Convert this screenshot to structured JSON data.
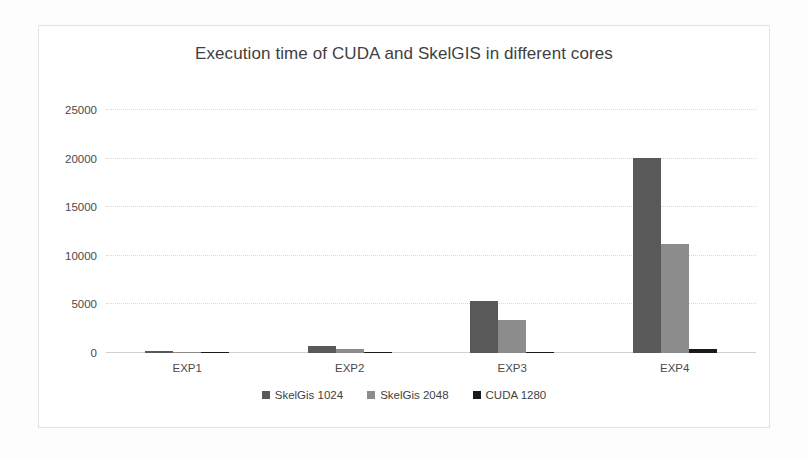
{
  "chart_data": {
    "type": "bar",
    "title": "Execution time of CUDA and SkelGIS in different cores",
    "xlabel": "",
    "ylabel": "",
    "categories": [
      "EXP1",
      "EXP2",
      "EXP3",
      "EXP4"
    ],
    "series": [
      {
        "name": "SkelGis 1024",
        "color": "#595959",
        "values": [
          200,
          700,
          5300,
          20100
        ]
      },
      {
        "name": "SkelGis 2048",
        "color": "#8c8c8c",
        "values": [
          60,
          450,
          3400,
          11200
        ]
      },
      {
        "name": "CUDA 1280",
        "color": "#1a1a1a",
        "values": [
          30,
          60,
          120,
          400
        ]
      }
    ],
    "ylim": [
      0,
      25000
    ],
    "yticks": [
      0,
      5000,
      10000,
      15000,
      20000,
      25000
    ],
    "ytick_labels": [
      "0",
      "5000",
      "10000",
      "15000",
      "20000",
      "25000"
    ],
    "grid": true,
    "legend_position": "bottom"
  }
}
